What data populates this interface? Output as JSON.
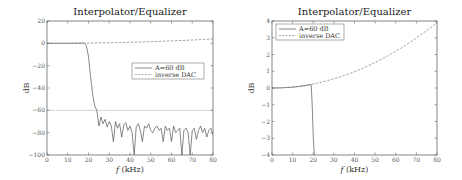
{
  "chart_data": [
    {
      "type": "line",
      "title": "Interpolator/Equalizer",
      "xlabel": "f (kHz)",
      "ylabel": "dB",
      "xlim": [
        0,
        80
      ],
      "ylim": [
        -100,
        20
      ],
      "xticks": [
        0,
        10,
        20,
        30,
        40,
        50,
        60,
        70,
        80
      ],
      "yticks": [
        20,
        0,
        -20,
        -40,
        -60,
        -80,
        -100
      ],
      "grid": false,
      "reference_line": {
        "y": -60,
        "color": "#cccccc"
      },
      "legend": {
        "position": "center-right",
        "entries": [
          "A=60 dB",
          "inverse DAC"
        ]
      },
      "series": [
        {
          "name": "A=60 dB",
          "style": "solid",
          "x": [
            0,
            5,
            10,
            15,
            18,
            19,
            20,
            21,
            22,
            23,
            24,
            25,
            26,
            27,
            28,
            29,
            30,
            31,
            32,
            33,
            34,
            35,
            36,
            37,
            38,
            39,
            40,
            41,
            42,
            43,
            44,
            45,
            46,
            47,
            48,
            49,
            50,
            51,
            52,
            53,
            54,
            55,
            56,
            57,
            58,
            59,
            60,
            61,
            62,
            63,
            64,
            65,
            66,
            67,
            68,
            69,
            70,
            71,
            72,
            73,
            74,
            75,
            76,
            77,
            78,
            79,
            80
          ],
          "values": [
            0,
            0,
            0,
            0.1,
            0.2,
            -2,
            -12,
            -30,
            -46,
            -56,
            -60,
            -74,
            -66,
            -72,
            -68,
            -75,
            -70,
            -74,
            -88,
            -70,
            -76,
            -72,
            -84,
            -73,
            -71,
            -78,
            -74,
            -80,
            -100,
            -75,
            -72,
            -78,
            -88,
            -74,
            -76,
            -72,
            -78,
            -80,
            -76,
            -74,
            -78,
            -76,
            -88,
            -74,
            -78,
            -76,
            -88,
            -74,
            -80,
            -78,
            -76,
            -100,
            -78,
            -76,
            -80,
            -100,
            -78,
            -76,
            -86,
            -78,
            -74,
            -80,
            -76,
            -84,
            -78,
            -76,
            -82
          ]
        },
        {
          "name": "inverse DAC",
          "style": "dashed",
          "x": [
            0,
            10,
            20,
            30,
            40,
            50,
            60,
            70,
            80
          ],
          "values": [
            0,
            0.06,
            0.24,
            0.55,
            0.98,
            1.55,
            2.25,
            3.0,
            3.9
          ]
        }
      ]
    },
    {
      "type": "line",
      "title": "Interpolator/Equalizer",
      "xlabel": "f (kHz)",
      "ylabel": "dB",
      "xlim": [
        0,
        80
      ],
      "ylim": [
        -4,
        4
      ],
      "xticks": [
        0,
        10,
        20,
        30,
        40,
        50,
        60,
        70,
        80
      ],
      "yticks": [
        4,
        3,
        2,
        1,
        0,
        -1,
        -2,
        -3,
        -4
      ],
      "grid": false,
      "legend": {
        "position": "upper-left",
        "entries": [
          "A=60 dB",
          "inverse DAC"
        ]
      },
      "series": [
        {
          "name": "A=60 dB",
          "style": "solid",
          "x": [
            0,
            5,
            10,
            15,
            19,
            19.5,
            20,
            20.5
          ],
          "values": [
            0,
            0.01,
            0.05,
            0.12,
            0.2,
            -1,
            -3,
            -4
          ]
        },
        {
          "name": "inverse DAC",
          "style": "dashed",
          "x": [
            0,
            10,
            20,
            30,
            40,
            50,
            60,
            70,
            80
          ],
          "values": [
            0,
            0.06,
            0.24,
            0.55,
            0.98,
            1.55,
            2.25,
            3.0,
            3.9
          ]
        }
      ]
    }
  ]
}
